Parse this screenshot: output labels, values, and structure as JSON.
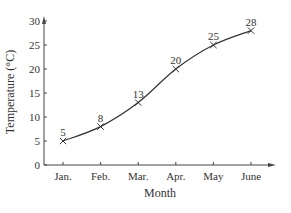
{
  "chart_data": {
    "type": "line",
    "title": "",
    "xlabel": "Month",
    "ylabel": "Temperature (°C)",
    "categories": [
      "Jan.",
      "Feb.",
      "Mar.",
      "Apr.",
      "May",
      "June"
    ],
    "values": [
      5,
      8,
      13,
      20,
      25,
      28
    ],
    "data_labels": [
      "5",
      "8",
      "13",
      "20",
      "25",
      "28"
    ],
    "y_ticks": [
      "0",
      "5",
      "10",
      "15",
      "20",
      "25",
      "30"
    ],
    "ylim": [
      0,
      30
    ],
    "grid": false,
    "legend": null,
    "marker": "x",
    "line_color": "#333333"
  }
}
